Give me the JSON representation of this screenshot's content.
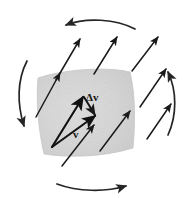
{
  "figure": {
    "background_color": "#ffffff",
    "width": 194,
    "height": 198
  },
  "labels": {
    "delta_v": "Δv",
    "v": "v"
  },
  "patch": {
    "name": "shaded-fluid-element",
    "fill_color": "#d6d6d6",
    "edge_color": "#c4c4c4",
    "description": "curved-sided quadrilateral fluid parcel",
    "corners": [
      [
        38,
        78
      ],
      [
        130,
        72
      ],
      [
        133,
        148
      ],
      [
        44,
        154
      ]
    ]
  },
  "vector_field": {
    "arrow_color": "#1a1a1a",
    "direction_degrees": 48,
    "count": 12,
    "arrows": [
      {
        "name": "field-arrow-1",
        "x1": 56,
        "y1": 80,
        "x2": 80,
        "y2": 38
      },
      {
        "name": "field-arrow-2",
        "x1": 94,
        "y1": 74,
        "x2": 117,
        "y2": 36
      },
      {
        "name": "field-arrow-3",
        "x1": 132,
        "y1": 72,
        "x2": 158,
        "y2": 36
      },
      {
        "name": "field-arrow-4",
        "x1": 36,
        "y1": 118,
        "x2": 60,
        "y2": 72
      },
      {
        "name": "field-arrow-5",
        "x1": 140,
        "y1": 108,
        "x2": 166,
        "y2": 68
      },
      {
        "name": "field-arrow-6",
        "x1": 147,
        "y1": 140,
        "x2": 172,
        "y2": 103
      },
      {
        "name": "field-arrow-7",
        "x1": 100,
        "y1": 152,
        "x2": 130,
        "y2": 110
      },
      {
        "name": "field-arrow-8",
        "x1": 62,
        "y1": 167,
        "x2": 94,
        "y2": 124
      }
    ]
  },
  "velocity_triangle": {
    "origin": [
      52,
      147
    ],
    "v_tip": [
      84,
      96
    ],
    "v2_tip": [
      95,
      116
    ],
    "delta_v_from": [
      84,
      96
    ],
    "delta_v_to": [
      95,
      116
    ],
    "description": "v and v+dv from common origin; Δv closes the triangle"
  },
  "circulation": {
    "sense": "counterclockwise",
    "arc_color": "#262626",
    "arcs": [
      {
        "name": "circulation-arc-top",
        "points_toward": "left"
      },
      {
        "name": "circulation-arc-left",
        "points_toward": "down"
      },
      {
        "name": "circulation-arc-bottom",
        "points_toward": "right"
      },
      {
        "name": "circulation-arc-right",
        "points_toward": "up"
      }
    ]
  }
}
